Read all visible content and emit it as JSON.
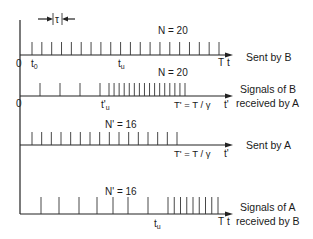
{
  "diagram": {
    "title_marker": {
      "label": "τ"
    },
    "rows": [
      {
        "id": "sent-by-b",
        "count_label": "N = 20",
        "side_label_lines": [
          "Sent by B"
        ],
        "axis_var": "t",
        "end_label": "T",
        "origin_label": "0",
        "points": [
          {
            "label": "t0",
            "sub": "0"
          },
          {
            "label": "tu",
            "sub": "u"
          }
        ],
        "tick_count": 20
      },
      {
        "id": "signals-b-received-a",
        "count_label": "N = 20",
        "side_label_lines": [
          "Signals of B",
          "received by A"
        ],
        "axis_var": "t'",
        "end_label": "T' = T / γ",
        "origin_label": "0",
        "points": [
          {
            "label": "t'u"
          }
        ],
        "tick_count": 20,
        "sparse_ticks": 4,
        "dense_ticks": 16
      },
      {
        "id": "sent-by-a",
        "count_label": "N' = 16",
        "side_label_lines": [
          "Sent by A"
        ],
        "axis_var": "t'",
        "end_label": "T' = T / γ",
        "tick_count": 16
      },
      {
        "id": "signals-a-received-b",
        "count_label": "N' = 16",
        "side_label_lines": [
          "Signals of A",
          "received by B"
        ],
        "axis_var": "t",
        "end_label": "T",
        "points": [
          {
            "label": "tu"
          }
        ],
        "tick_count": 16,
        "sparse_ticks": 7,
        "dense_ticks": 9
      }
    ]
  },
  "text": {
    "tau": "τ",
    "r1_count": "N = 20",
    "r1_side": "Sent by B",
    "r1_origin": "0",
    "r1_t0": "t",
    "r1_t0_sub": "0",
    "r1_tu": "t",
    "r1_tu_sub": "u",
    "r1_end": "T",
    "r1_var": "t",
    "r2_count": "N = 20",
    "r2_side_1": "Signals of B",
    "r2_side_2": "received by A",
    "r2_origin": "0",
    "r2_tu": "t'",
    "r2_tu_sub": "u",
    "r2_end": "T' = T / γ",
    "r2_var": "t'",
    "r3_count": "N' = 16",
    "r3_side": "Sent by A",
    "r3_end": "T' = T / γ",
    "r3_var": "t'",
    "r4_count": "N' = 16",
    "r4_side_1": "Signals of A",
    "r4_side_2": "received by B",
    "r4_tu": "t",
    "r4_tu_sub": "u",
    "r4_end": "T",
    "r4_var": "t"
  }
}
